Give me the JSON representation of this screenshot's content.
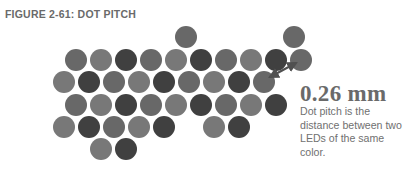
{
  "figure": {
    "caption": "FIGURE 2-61: DOT PITCH",
    "measurement": "0.26 mm",
    "description": "Dot pitch is the distance between two LEDs of the same color."
  },
  "colors": {
    "light": "#787878",
    "mid": "#686868",
    "dark": "#404040",
    "arrow": "#505050",
    "text": "#6a6a6a"
  },
  "dots": [
    {
      "x": 186,
      "y": 37,
      "c": "mid"
    },
    {
      "x": 294,
      "y": 37,
      "c": "mid"
    },
    {
      "x": 76,
      "y": 60,
      "c": "mid"
    },
    {
      "x": 101,
      "y": 60,
      "c": "light"
    },
    {
      "x": 126,
      "y": 60,
      "c": "dark"
    },
    {
      "x": 151,
      "y": 60,
      "c": "mid"
    },
    {
      "x": 176,
      "y": 60,
      "c": "light"
    },
    {
      "x": 201,
      "y": 60,
      "c": "dark"
    },
    {
      "x": 226,
      "y": 60,
      "c": "mid"
    },
    {
      "x": 251,
      "y": 60,
      "c": "light"
    },
    {
      "x": 276,
      "y": 60,
      "c": "dark"
    },
    {
      "x": 301,
      "y": 60,
      "c": "mid"
    },
    {
      "x": 64,
      "y": 82,
      "c": "light"
    },
    {
      "x": 89,
      "y": 82,
      "c": "dark"
    },
    {
      "x": 114,
      "y": 82,
      "c": "mid"
    },
    {
      "x": 139,
      "y": 82,
      "c": "light"
    },
    {
      "x": 164,
      "y": 82,
      "c": "dark"
    },
    {
      "x": 189,
      "y": 82,
      "c": "mid"
    },
    {
      "x": 214,
      "y": 82,
      "c": "light"
    },
    {
      "x": 239,
      "y": 82,
      "c": "dark"
    },
    {
      "x": 264,
      "y": 82,
      "c": "mid"
    },
    {
      "x": 76,
      "y": 105,
      "c": "mid"
    },
    {
      "x": 101,
      "y": 105,
      "c": "light"
    },
    {
      "x": 126,
      "y": 105,
      "c": "dark"
    },
    {
      "x": 151,
      "y": 105,
      "c": "mid"
    },
    {
      "x": 176,
      "y": 105,
      "c": "light"
    },
    {
      "x": 201,
      "y": 105,
      "c": "dark"
    },
    {
      "x": 226,
      "y": 105,
      "c": "mid"
    },
    {
      "x": 251,
      "y": 105,
      "c": "light"
    },
    {
      "x": 276,
      "y": 105,
      "c": "dark"
    },
    {
      "x": 64,
      "y": 127,
      "c": "light"
    },
    {
      "x": 89,
      "y": 127,
      "c": "dark"
    },
    {
      "x": 114,
      "y": 127,
      "c": "mid"
    },
    {
      "x": 139,
      "y": 127,
      "c": "light"
    },
    {
      "x": 164,
      "y": 127,
      "c": "dark"
    },
    {
      "x": 214,
      "y": 127,
      "c": "light"
    },
    {
      "x": 239,
      "y": 127,
      "c": "dark"
    },
    {
      "x": 101,
      "y": 149,
      "c": "light"
    },
    {
      "x": 126,
      "y": 149,
      "c": "dark"
    }
  ],
  "dot_radius": 11,
  "arrow": {
    "x1": 270,
    "y1": 77,
    "x2": 296,
    "y2": 63
  }
}
